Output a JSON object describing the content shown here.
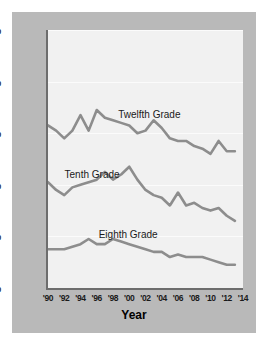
{
  "chart_data": {
    "type": "line",
    "title": "",
    "xlabel": "Year",
    "ylabel": "",
    "ylim": [
      0,
      50
    ],
    "xlim": [
      1990,
      2014
    ],
    "grid": true,
    "legend_position": "inline-annotations",
    "y_ticks": [
      "0%",
      "10%",
      "20%",
      "30%",
      "40%",
      "50%"
    ],
    "y_tick_values": [
      0,
      10,
      20,
      30,
      40,
      50
    ],
    "x_ticks": [
      "'90",
      "'92",
      "'94",
      "'96",
      "'98",
      "'00",
      "'02",
      "'04",
      "'06",
      "'08",
      "'10",
      "'12",
      "'14"
    ],
    "x_tick_values": [
      1990,
      1992,
      1994,
      1996,
      1998,
      2000,
      2002,
      2004,
      2006,
      2008,
      2010,
      2012,
      2014
    ],
    "x": [
      1990,
      1991,
      1992,
      1993,
      1994,
      1995,
      1996,
      1997,
      1998,
      1999,
      2000,
      2001,
      2002,
      2003,
      2004,
      2005,
      2006,
      2007,
      2008,
      2009,
      2010,
      2011,
      2012,
      2013
    ],
    "series": [
      {
        "name": "Twelfth Grade",
        "color": "#8d8d8d",
        "values": [
          31.5,
          30.5,
          29.0,
          30.5,
          33.5,
          30.5,
          34.5,
          33.0,
          32.5,
          32.0,
          31.5,
          30.0,
          30.5,
          32.5,
          31.0,
          29.0,
          28.5,
          28.5,
          27.5,
          27.0,
          26.0,
          28.5,
          26.5,
          26.5
        ]
      },
      {
        "name": "Tenth Grade",
        "color": "#8d8d8d",
        "values": [
          20.5,
          19.0,
          18.0,
          19.5,
          20.0,
          20.5,
          21.0,
          22.5,
          21.0,
          22.0,
          23.5,
          21.0,
          19.0,
          18.0,
          17.5,
          16.0,
          18.5,
          16.0,
          16.5,
          15.5,
          15.0,
          15.5,
          14.0,
          13.0
        ]
      },
      {
        "name": "Eighth Grade",
        "color": "#8d8d8d",
        "values": [
          7.5,
          7.5,
          7.5,
          8.0,
          8.5,
          9.5,
          8.5,
          8.5,
          9.5,
          9.0,
          8.5,
          8.0,
          7.5,
          7.0,
          7.0,
          6.0,
          6.5,
          6.0,
          6.0,
          6.0,
          5.5,
          5.0,
          4.5,
          4.5
        ]
      }
    ],
    "annotations": [
      {
        "text": "Twelfth Grade",
        "x_pct": 36.0,
        "y_pct": 30.5
      },
      {
        "text": "Tenth Grade",
        "x_pct": 8.5,
        "y_pct": 54.0
      },
      {
        "text": "Eighth Grade",
        "x_pct": 26.0,
        "y_pct": 77.0
      }
    ]
  },
  "colors": {
    "card_background": "#b9b9b9",
    "plot_background": "#f1f1f1",
    "axis": "#6d6d6d",
    "line": "#8d8d8d",
    "gridline": "#fbfbfb",
    "text": "#1a1a1a"
  }
}
